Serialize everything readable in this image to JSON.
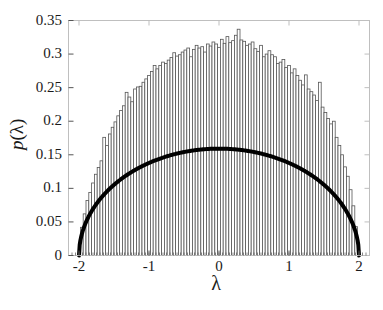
{
  "chart_data": {
    "type": "bar",
    "title": "",
    "subtitle": "",
    "xlabel": "λ",
    "ylabel": "p(λ)",
    "xlim": [
      -2.15,
      2.15
    ],
    "ylim": [
      0,
      0.35
    ],
    "xticks": [
      -2,
      -1,
      0,
      1,
      2
    ],
    "xticklabels": [
      "-2",
      "-1",
      "0",
      "1",
      "2"
    ],
    "yticks": [
      0,
      0.05,
      0.1,
      0.15,
      0.2,
      0.25,
      0.3,
      0.35
    ],
    "yticklabels": [
      "0",
      "0.05",
      "0.1",
      "0.15",
      "0.2",
      "0.25",
      "0.3",
      "0.35"
    ],
    "grid": false,
    "legend": "none",
    "annotations": [],
    "series": [
      {
        "name": "histogram",
        "type": "bar",
        "edge_color": "#555555",
        "fill_color": "#ffffff",
        "bin_width": 0.04,
        "bin_centers": [
          -1.96,
          -1.92,
          -1.88,
          -1.84,
          -1.8,
          -1.76,
          -1.72,
          -1.68,
          -1.64,
          -1.6,
          -1.56,
          -1.52,
          -1.48,
          -1.44,
          -1.4,
          -1.36,
          -1.32,
          -1.28,
          -1.24,
          -1.2,
          -1.16,
          -1.12,
          -1.08,
          -1.04,
          -1.0,
          -0.96,
          -0.92,
          -0.88,
          -0.84,
          -0.8,
          -0.76,
          -0.72,
          -0.68,
          -0.64,
          -0.6,
          -0.56,
          -0.52,
          -0.48,
          -0.44,
          -0.4,
          -0.36,
          -0.32,
          -0.28,
          -0.24,
          -0.2,
          -0.16,
          -0.12,
          -0.08,
          -0.04,
          0.0,
          0.04,
          0.08,
          0.12,
          0.16,
          0.2,
          0.24,
          0.28,
          0.32,
          0.36,
          0.4,
          0.44,
          0.48,
          0.52,
          0.56,
          0.6,
          0.64,
          0.68,
          0.72,
          0.76,
          0.8,
          0.84,
          0.88,
          0.92,
          0.96,
          1.0,
          1.04,
          1.08,
          1.12,
          1.16,
          1.2,
          1.24,
          1.28,
          1.32,
          1.36,
          1.4,
          1.44,
          1.48,
          1.52,
          1.56,
          1.6,
          1.64,
          1.68,
          1.72,
          1.76,
          1.8,
          1.84,
          1.88,
          1.92,
          1.96
        ],
        "values": [
          0.042,
          0.062,
          0.082,
          0.094,
          0.108,
          0.121,
          0.131,
          0.141,
          0.176,
          0.164,
          0.181,
          0.191,
          0.199,
          0.208,
          0.216,
          0.223,
          0.243,
          0.236,
          0.229,
          0.248,
          0.251,
          0.252,
          0.258,
          0.263,
          0.268,
          0.274,
          0.283,
          0.278,
          0.283,
          0.288,
          0.286,
          0.291,
          0.295,
          0.302,
          0.297,
          0.299,
          0.303,
          0.306,
          0.309,
          0.296,
          0.307,
          0.313,
          0.309,
          0.311,
          0.303,
          0.315,
          0.312,
          0.318,
          0.315,
          0.31,
          0.322,
          0.316,
          0.326,
          0.317,
          0.32,
          0.328,
          0.337,
          0.321,
          0.319,
          0.313,
          0.315,
          0.318,
          0.308,
          0.304,
          0.313,
          0.296,
          0.3,
          0.305,
          0.299,
          0.296,
          0.286,
          0.288,
          0.292,
          0.28,
          0.283,
          0.272,
          0.278,
          0.268,
          0.261,
          0.254,
          0.269,
          0.248,
          0.244,
          0.239,
          0.231,
          0.258,
          0.221,
          0.213,
          0.204,
          0.196,
          0.2,
          0.176,
          0.164,
          0.15,
          0.132,
          0.118,
          0.098,
          0.074,
          0.043
        ]
      },
      {
        "name": "semicircle-law",
        "type": "line",
        "color": "#000000",
        "line_width": 4,
        "formula": "p(lambda) = sqrt(4 - lambda^2) / (2*pi)",
        "peak_value": 0.3183,
        "support": [
          -2,
          2
        ],
        "x": [
          -2.0,
          -1.95,
          -1.9,
          -1.85,
          -1.8,
          -1.7,
          -1.6,
          -1.5,
          -1.4,
          -1.3,
          -1.2,
          -1.1,
          -1.0,
          -0.9,
          -0.8,
          -0.7,
          -0.6,
          -0.5,
          -0.4,
          -0.3,
          -0.2,
          -0.1,
          0.0,
          0.1,
          0.2,
          0.3,
          0.4,
          0.5,
          0.6,
          0.7,
          0.8,
          0.9,
          1.0,
          1.1,
          1.2,
          1.3,
          1.4,
          1.5,
          1.6,
          1.7,
          1.8,
          1.85,
          1.9,
          1.95,
          2.0
        ],
        "y": [
          0.0,
          0.0701,
          0.0985,
          0.1199,
          0.1376,
          0.1672,
          0.191,
          0.2104,
          0.2273,
          0.2419,
          0.2546,
          0.2655,
          0.2757,
          0.2843,
          0.292,
          0.2983,
          0.3037,
          0.3083,
          0.3119,
          0.3147,
          0.3167,
          0.3179,
          0.3183,
          0.3179,
          0.3167,
          0.3147,
          0.3119,
          0.3083,
          0.3037,
          0.2983,
          0.292,
          0.2843,
          0.2757,
          0.2655,
          0.2546,
          0.2419,
          0.2273,
          0.2104,
          0.191,
          0.1672,
          0.1376,
          0.1199,
          0.0985,
          0.0701,
          0.0
        ]
      }
    ]
  },
  "axes": {
    "box_color": "#bfbfbf",
    "tick_color": "#555555"
  }
}
